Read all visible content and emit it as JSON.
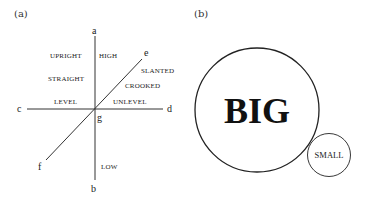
{
  "panel_a": {
    "label": "(a)",
    "axis_endpoints": {
      "a": "a",
      "b": "b",
      "c": "c",
      "d": "d",
      "e": "e",
      "f": "f",
      "g": "g"
    },
    "words": {
      "upright": "UPRIGHT",
      "high": "HIGH",
      "straight": "STRAIGHT",
      "slanted": "SLANTED",
      "crooked": "CROOKED",
      "level": "LEVEL",
      "unlevel": "UNLEVEL",
      "low": "LOW"
    }
  },
  "panel_b": {
    "label": "(b)",
    "big_circle_text": "BIG",
    "small_circle_text": "SMALL"
  }
}
